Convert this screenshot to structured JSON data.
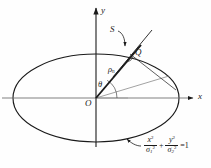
{
  "figure": {
    "type": "geometry-diagram",
    "axes": {
      "x_label": "x",
      "y_label": "y",
      "origin_label": "O"
    },
    "annotations": {
      "tangent_label": "S",
      "point_label": "Q",
      "radius_label": "ρ",
      "radius_subscript": "n",
      "angle_label": "θ"
    },
    "equation": {
      "term1_num": "x",
      "term1_num_sup": "2",
      "term1_den": "σ",
      "term1_den_sub": "1",
      "term1_den_sup": "2",
      "operator": "+",
      "term2_num": "y",
      "term2_num_sup": "2",
      "term2_den": "σ",
      "term2_den_sub": "2",
      "term2_den_sup": "2",
      "rhs": "=1"
    },
    "colors": {
      "stroke": "#1a1a1a",
      "thin_stroke": "#555555",
      "background": "#fefefe"
    }
  }
}
